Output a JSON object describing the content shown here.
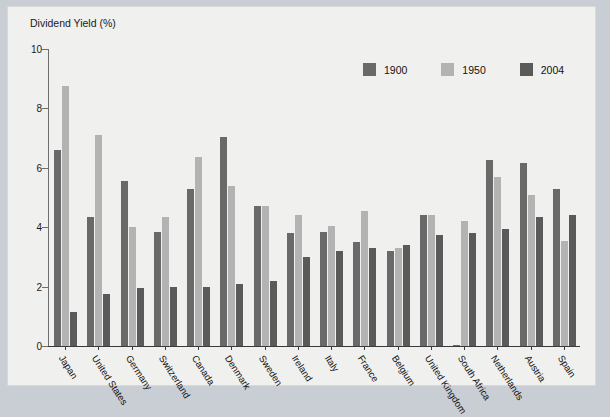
{
  "chart_data": {
    "type": "bar",
    "title": "Dividend Yield (%)",
    "ylabel": "Dividend Yield (%)",
    "xlabel": "",
    "ylim": [
      0,
      10
    ],
    "yticks": [
      0,
      2,
      4,
      6,
      8,
      10
    ],
    "ytick_labels": [
      "0",
      "2",
      "4",
      "6",
      "8",
      "10"
    ],
    "grid": false,
    "legend_position": "top-right",
    "categories": [
      "Japan",
      "United States",
      "Germany",
      "Switzerland",
      "Canada",
      "Denmark",
      "Sweden",
      "Ireland",
      "Italy",
      "France",
      "Belgium",
      "United Kingdom",
      "South Africa",
      "Netherlands",
      "Austria",
      "Spain"
    ],
    "series": [
      {
        "name": "1900",
        "color": "#696969",
        "values": [
          6.6,
          4.35,
          5.55,
          3.85,
          5.3,
          7.05,
          4.7,
          3.8,
          3.85,
          3.5,
          3.2,
          4.4,
          0.05,
          6.25,
          6.15,
          5.3
        ]
      },
      {
        "name": "1950",
        "color": "#b3b3b3",
        "values": [
          8.75,
          7.1,
          4.0,
          4.35,
          6.35,
          5.4,
          4.7,
          4.4,
          4.05,
          4.55,
          3.3,
          4.4,
          4.2,
          5.7,
          5.1,
          3.55
        ]
      },
      {
        "name": "2004",
        "color": "#5a5a5a",
        "values": [
          1.15,
          1.75,
          1.95,
          2.0,
          2.0,
          2.1,
          2.2,
          3.0,
          3.2,
          3.3,
          3.4,
          3.75,
          3.8,
          3.95,
          4.35,
          4.4
        ]
      }
    ]
  }
}
